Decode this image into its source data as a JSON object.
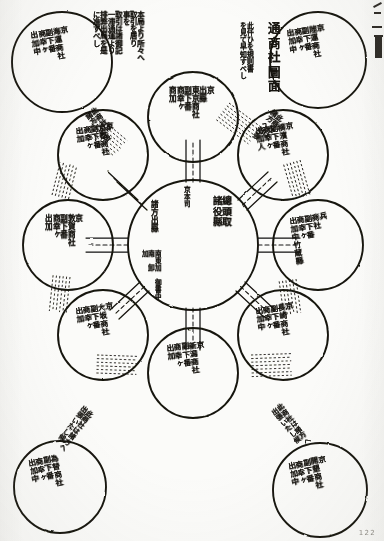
{
  "document": {
    "type": "hand-drawn-diagram",
    "title": "通商社圖面",
    "page_number": "122",
    "language": "ja",
    "script_direction": "vertical-rtl",
    "ink_color": "#16140f",
    "paper_color": "#fbfbf9"
  },
  "annotations": {
    "title_note": "此仟ひを規則書\nを見て早知すべし",
    "top_left_block": "本局より所々へ\n取引を居り\n事を\n取引は諸御記\n一滞通運より\n排弊出局を是\nに准ずべし"
  },
  "center": {
    "name": "總頭取 諸役縣",
    "label_top": "京本司",
    "label_right": "總頭取\n諸役縣",
    "label_left": "諸方出縣",
    "label_sub": "南東加　御書中\n南　卸\n加"
  },
  "satellites": [
    {
      "id": "n",
      "name": "東京商社",
      "text": "京\n出縣\n東京商社\n副下番\n商幸ヶ\n商加"
    },
    {
      "id": "ne",
      "name": "横濱商社",
      "text": "京\n横濱商社\n副下番\n商幸ヶ\n出加人"
    },
    {
      "id": "e",
      "name": "兵庫商社",
      "text": "兵\n商社\n副下番\n商幸ヶ\n出加中竹蔵縣"
    },
    {
      "id": "se",
      "name": "長崎商社",
      "text": "京\n長崎商社\n副下番\n商幸ヶ\n出加中"
    },
    {
      "id": "s",
      "name": "新潟商社",
      "text": "京\n新潟商社\n副下番\n商幸ヶ\n出加"
    },
    {
      "id": "sw",
      "name": "大坂商社",
      "text": "京\n大坂商社\n副下番\n商幸ヶ\n出加"
    },
    {
      "id": "w",
      "name": "敦賀商社",
      "text": "京\n敦賀商社\n副下番\n商幸ヶ\n出加"
    },
    {
      "id": "nw",
      "name": "京都商社",
      "text": "京\n京都商社\n副下番\n商幸ヶ\n出加"
    }
  ],
  "outer_nodes": [
    {
      "id": "outer-top-left",
      "name": "海運商社",
      "text": "京\n海運商社\n副下番\n商幸ヶ\n出加中"
    },
    {
      "id": "outer-top-right",
      "name": "陸運商社",
      "text": "京\n陸運商社\n副下番\n商幸ヶ\n出加中"
    },
    {
      "id": "outer-bottom-left",
      "name": "為替商社",
      "text": "為替商社\n副下番\n商幸ヶ\n出加中"
    },
    {
      "id": "outer-bottom-right",
      "name": "開墾商社",
      "text": "京\n開墾商社\n副下番\n商幸ヶ\n出加中"
    }
  ],
  "connector_labels": [
    {
      "id": "conn-top-left",
      "text": "此商社は\n諸方へ出張"
    },
    {
      "id": "conn-top-right",
      "text": "此商社は\n諸方へ出張"
    },
    {
      "id": "conn-bottom-left",
      "text": "此商社は諸方へ\n出張いたし候"
    },
    {
      "id": "conn-bottom-right",
      "text": "此商社は諸方へ\n出張いたし候"
    }
  ]
}
